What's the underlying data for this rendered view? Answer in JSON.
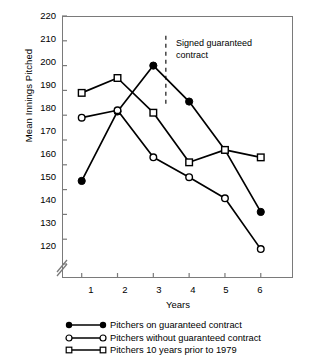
{
  "chart_data": {
    "type": "line",
    "title": "",
    "xlabel": "Years",
    "ylabel": "Mean Innings Pitched",
    "x": [
      1,
      2,
      3,
      4,
      5,
      6
    ],
    "xtick_labels": [
      "1",
      "2",
      "3",
      "4",
      "5",
      "6"
    ],
    "ytick_labels": [
      "120",
      "130",
      "140",
      "150",
      "160",
      "170",
      "180",
      "190",
      "200",
      "210",
      "220"
    ],
    "ylim": [
      120,
      220
    ],
    "ytick_step": 10,
    "xlim": [
      0.45,
      6.9
    ],
    "grid": false,
    "axis_break": true,
    "legend_position": "below-plot",
    "series": [
      {
        "name": "Pitchers on guaranteed contract",
        "marker": "filled-circle",
        "color": "#000000",
        "values": [
          153.5,
          181.5,
          200,
          185.5,
          166,
          141
        ]
      },
      {
        "name": "Pitchers without guaranteed contract",
        "marker": "open-circle",
        "color": "#000000",
        "values": [
          179,
          182,
          163,
          155,
          146.5,
          126
        ]
      },
      {
        "name": "Pitchers 10 years prior to 1979",
        "marker": "open-square",
        "color": "#000000",
        "values": [
          189,
          195,
          181,
          161,
          166,
          163
        ]
      }
    ],
    "annotations": [
      {
        "name": "signed-guaranteed-contract",
        "text_line1": "Signed guaranteed",
        "text_line2": "contract",
        "marker_type": "vertical-dashed-line",
        "x_position": 3.35
      }
    ]
  },
  "axis": {
    "ylabel": "Mean Innings Pitched",
    "xlabel": "Years",
    "yticks": [
      "220",
      "210",
      "200",
      "190",
      "180",
      "170",
      "160",
      "150",
      "140",
      "130",
      "120"
    ],
    "xticks": [
      "1",
      "2",
      "3",
      "4",
      "5",
      "6"
    ]
  },
  "annotation": {
    "line1": "Signed guaranteed",
    "line2": "contract"
  },
  "legend": {
    "items": [
      {
        "label": "Pitchers on guaranteed contract",
        "marker": "filled-circle"
      },
      {
        "label": "Pitchers without guaranteed contract",
        "marker": "open-circle"
      },
      {
        "label": "Pitchers 10 years prior to 1979",
        "marker": "open-square"
      }
    ]
  },
  "colors": {
    "ink": "#000000",
    "axis": "#7a7a7a",
    "background": "#ffffff"
  }
}
